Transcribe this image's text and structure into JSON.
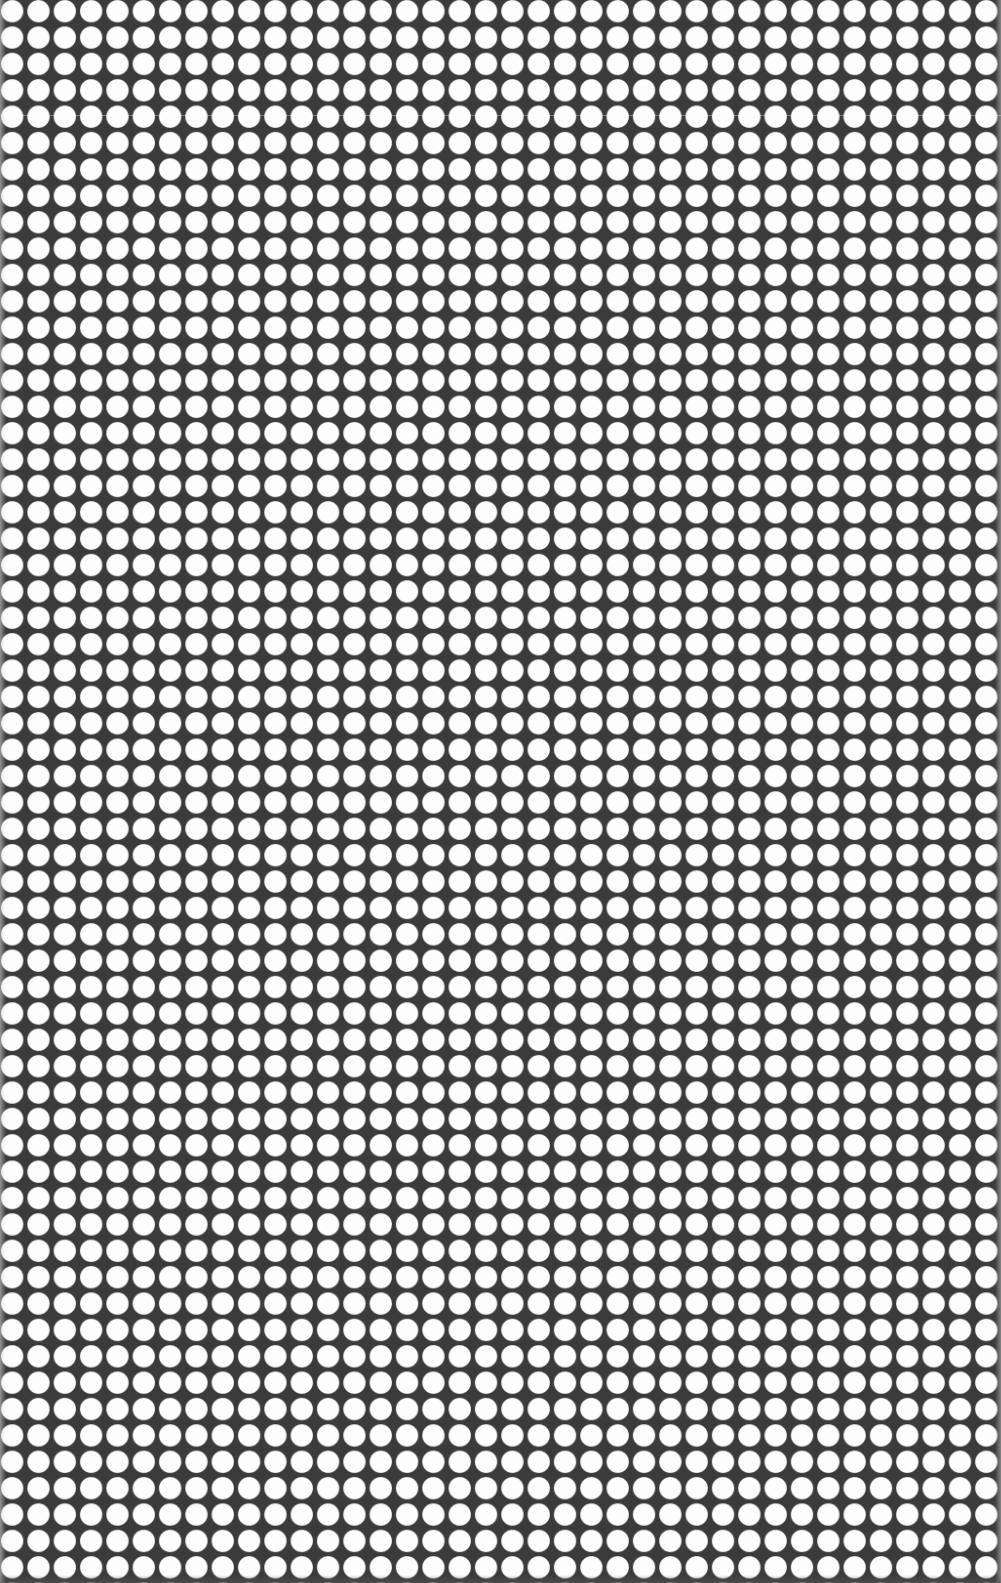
{
  "image": {
    "description": "dot-grid-pattern",
    "background_color": "#3b3b3b",
    "dot_color": "#fdfdfd",
    "columns": 38,
    "rows": 60,
    "dot_pitch_px": 26.4,
    "dot_diameter_px": 22
  }
}
